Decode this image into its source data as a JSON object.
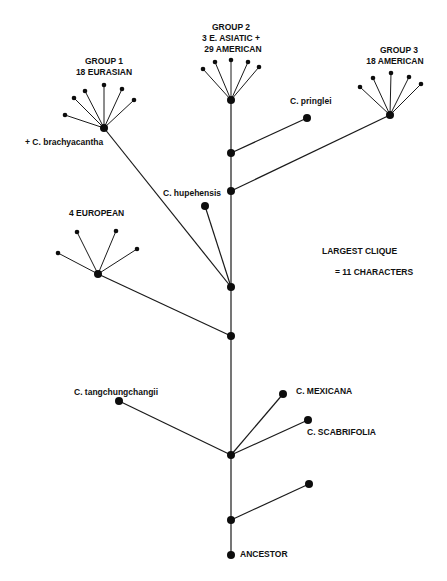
{
  "diagram": {
    "type": "phylogenetic-tree",
    "colors": {
      "line": "#1a1a1a",
      "node": "#0d0d0d",
      "background": "#ffffff"
    },
    "labels": {
      "group1_line1": "GROUP 1",
      "group1_line2": "18 EURASIAN",
      "group2_line1": "GROUP 2",
      "group2_line2": "3 E. ASIATIC +",
      "group2_line3": "29 AMERICAN",
      "group3_line1": "GROUP 3",
      "group3_line2": "18 AMERICAN",
      "brachyacantha": "+ C. brachyacantha",
      "pringlei": "C. pringlei",
      "hupehensis": "C. hupehensis",
      "european": "4 EUROPEAN",
      "clique_line1": "LARGEST CLIQUE",
      "clique_line2": "= 11 CHARACTERS",
      "tangchungchangii": "C. tangchungchangii",
      "mexicana": "C. MEXICANA",
      "scabrifolia": "C. SCABRIFOLIA",
      "ancestor": "ANCESTOR"
    },
    "nodes": [
      {
        "id": "ancestor",
        "x": 231,
        "y": 555,
        "r": 4
      },
      {
        "id": "trunk1",
        "x": 231,
        "y": 520,
        "r": 4
      },
      {
        "id": "leaf_unlabeled",
        "x": 309,
        "y": 484,
        "r": 4
      },
      {
        "id": "trunk2",
        "x": 231,
        "y": 455,
        "r": 4
      },
      {
        "id": "tangchungchangii",
        "x": 119,
        "y": 401,
        "r": 4
      },
      {
        "id": "mexicana",
        "x": 283,
        "y": 394,
        "r": 4
      },
      {
        "id": "scabrifolia",
        "x": 308,
        "y": 420,
        "r": 4
      },
      {
        "id": "trunk3",
        "x": 231,
        "y": 336,
        "r": 4
      },
      {
        "id": "european_hub",
        "x": 98,
        "y": 274,
        "r": 4
      },
      {
        "id": "trunk4",
        "x": 231,
        "y": 287,
        "r": 4
      },
      {
        "id": "hupehensis",
        "x": 205,
        "y": 206,
        "r": 4
      },
      {
        "id": "group1_hub",
        "x": 104,
        "y": 128,
        "r": 4
      },
      {
        "id": "trunk5",
        "x": 231,
        "y": 191,
        "r": 4
      },
      {
        "id": "group3_hub",
        "x": 390,
        "y": 115,
        "r": 4
      },
      {
        "id": "trunk6",
        "x": 231,
        "y": 153,
        "r": 4
      },
      {
        "id": "pringlei",
        "x": 307,
        "y": 118,
        "r": 4
      },
      {
        "id": "group2_hub",
        "x": 231,
        "y": 100,
        "r": 4
      }
    ],
    "edges": [
      [
        "ancestor",
        "trunk1"
      ],
      [
        "trunk1",
        "trunk2"
      ],
      [
        "trunk2",
        "trunk3"
      ],
      [
        "trunk3",
        "trunk4"
      ],
      [
        "trunk4",
        "trunk5"
      ],
      [
        "trunk5",
        "trunk6"
      ],
      [
        "trunk6",
        "group2_hub"
      ],
      [
        "trunk1",
        "leaf_unlabeled"
      ],
      [
        "trunk2",
        "tangchungchangii"
      ],
      [
        "trunk2",
        "mexicana"
      ],
      [
        "trunk2",
        "scabrifolia"
      ],
      [
        "trunk3",
        "european_hub"
      ],
      [
        "trunk4",
        "hupehensis"
      ],
      [
        "trunk4",
        "group1_hub"
      ],
      [
        "trunk5",
        "group3_hub"
      ],
      [
        "trunk6",
        "pringlei"
      ]
    ],
    "fans": [
      {
        "hub": "group1_hub",
        "leaves": [
          [
            65,
            115
          ],
          [
            74,
            98
          ],
          [
            85,
            91
          ],
          [
            104,
            85
          ],
          [
            122,
            89
          ],
          [
            134,
            100
          ]
        ]
      },
      {
        "hub": "group2_hub",
        "leaves": [
          [
            203,
            69
          ],
          [
            215,
            62
          ],
          [
            231,
            60
          ],
          [
            248,
            62
          ],
          [
            259,
            67
          ]
        ]
      },
      {
        "hub": "group3_hub",
        "leaves": [
          [
            360,
            87
          ],
          [
            373,
            78
          ],
          [
            391,
            73
          ],
          [
            409,
            77
          ],
          [
            421,
            84
          ]
        ]
      },
      {
        "hub": "european_hub",
        "leaves": [
          [
            58,
            253
          ],
          [
            77,
            232
          ],
          [
            116,
            231
          ],
          [
            137,
            249
          ]
        ]
      }
    ]
  }
}
